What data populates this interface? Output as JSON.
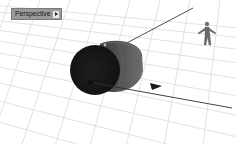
{
  "viewport": {
    "name": "Perspective",
    "menu_icon": "triangle-right-icon",
    "background": "#ffffff",
    "grid_color": "#d4d4d4"
  },
  "scene": {
    "objects": [
      {
        "type": "cylinder",
        "color": "#2a2a2a",
        "highlight": "#555555"
      },
      {
        "type": "line-with-arrow",
        "color": "#333333"
      },
      {
        "type": "human-figure",
        "color": "#6a6a6a"
      }
    ]
  }
}
